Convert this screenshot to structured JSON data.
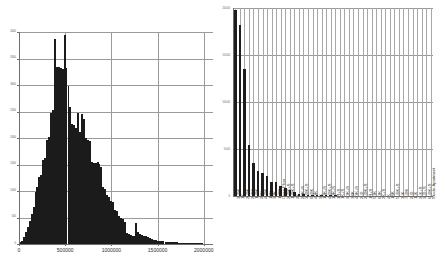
{
  "chart_data": [
    {
      "type": "bar",
      "subtype": "histogram",
      "title": "",
      "xlabel": "",
      "ylabel": "",
      "panel": "left",
      "xlim": [
        0,
        2100000
      ],
      "ylim": [
        0,
        4000
      ],
      "grid": true,
      "legend": "none",
      "xticks": [
        0,
        500000,
        1000000,
        1500000,
        2000000
      ],
      "xticklabels": [
        "0",
        "500000",
        "1000000",
        "1500000",
        "2000000"
      ],
      "yticks": [
        0,
        500,
        1000,
        1500,
        2000,
        2500,
        3000,
        3500,
        4000
      ],
      "yticklabels": [
        "0",
        "500",
        "1000",
        "1500",
        "2000",
        "2500",
        "3000",
        "3500",
        "4000"
      ],
      "bin_width": 21000,
      "bin_starts": [
        0,
        21000,
        42000,
        63000,
        84000,
        105000,
        126000,
        147000,
        168000,
        189000,
        210000,
        231000,
        252000,
        273000,
        294000,
        315000,
        336000,
        357000,
        378000,
        399000,
        420000,
        441000,
        462000,
        483000,
        504000,
        525000,
        546000,
        567000,
        588000,
        609000,
        630000,
        651000,
        672000,
        693000,
        714000,
        735000,
        756000,
        777000,
        798000,
        819000,
        840000,
        861000,
        882000,
        903000,
        924000,
        945000,
        966000,
        987000,
        1008000,
        1029000,
        1050000,
        1071000,
        1092000,
        1113000,
        1134000,
        1155000,
        1176000,
        1197000,
        1218000,
        1239000,
        1260000,
        1281000,
        1302000,
        1323000,
        1344000,
        1365000,
        1386000,
        1407000,
        1428000,
        1449000,
        1470000,
        1491000,
        1512000,
        1533000,
        1554000,
        1575000,
        1596000,
        1617000,
        1638000,
        1659000,
        1680000,
        1701000,
        1722000,
        1743000,
        1764000,
        1785000,
        1806000,
        1827000,
        1848000,
        1869000,
        1890000,
        1911000,
        1932000,
        1953000,
        1974000,
        1995000,
        2016000,
        2037000,
        2058000,
        2079000
      ],
      "counts": [
        30,
        60,
        140,
        230,
        330,
        430,
        560,
        700,
        980,
        1080,
        1260,
        1300,
        1580,
        1630,
        1960,
        2010,
        2480,
        2530,
        3870,
        3340,
        3340,
        3320,
        3310,
        3950,
        3320,
        2980,
        2590,
        2270,
        2240,
        2180,
        2480,
        2110,
        2460,
        2360,
        2000,
        1960,
        1950,
        1550,
        1530,
        1520,
        1540,
        1510,
        1450,
        1070,
        1040,
        920,
        890,
        820,
        800,
        640,
        620,
        530,
        500,
        470,
        420,
        200,
        180,
        170,
        160,
        150,
        400,
        230,
        180,
        170,
        160,
        150,
        140,
        120,
        100,
        80,
        70,
        60,
        55,
        50,
        48,
        45,
        42,
        40,
        38,
        36,
        34,
        30,
        28,
        26,
        24,
        22,
        20,
        18,
        16,
        15,
        14,
        13,
        12,
        11,
        10,
        9,
        8,
        7,
        6,
        5
      ]
    },
    {
      "type": "bar",
      "title": "",
      "xlabel": "",
      "ylabel": "",
      "panel": "right",
      "ylim": [
        0,
        20000
      ],
      "grid": true,
      "legend": "none",
      "yticks": [
        0,
        5000,
        10000,
        15000,
        20000
      ],
      "yticklabels": [
        "0",
        "5000",
        "10000",
        "15000",
        "20000"
      ],
      "categories": [
        "3LDK",
        "1K",
        "2LDK",
        "2LDK",
        "1LDK",
        "2DK",
        "4LDK",
        "1DK",
        "3DK",
        "1LDK",
        "Open Floor",
        "2LDK+S",
        "1LDK+S",
        "2K",
        "2DK+S",
        "3LDK+S",
        "6LDK",
        "4DK",
        "3K",
        "1DK+S",
        "4LDK+S",
        "1DK+S",
        "1R+S",
        "1K+S",
        "3DK+S",
        "3SK",
        "4DK+S",
        "2LD",
        "2LDK+S",
        "1R+S",
        "5DK",
        "6DK",
        "2K+S",
        "4K",
        "1SK",
        "5LDK+S",
        "3LK",
        "7LDK",
        "2LD",
        "1LK",
        "2LK+S",
        "3LD+S",
        "6LDK+S",
        "Studio Apartment"
      ],
      "values": [
        19800,
        18200,
        13500,
        5400,
        3500,
        2700,
        2500,
        2150,
        1500,
        1450,
        1100,
        850,
        620,
        420,
        260,
        180,
        140,
        110,
        95,
        80,
        70,
        62,
        55,
        48,
        42,
        38,
        34,
        30,
        27,
        24,
        21,
        19,
        17,
        15,
        13,
        12,
        11,
        10,
        9,
        8,
        7,
        6,
        5,
        4
      ]
    }
  ]
}
